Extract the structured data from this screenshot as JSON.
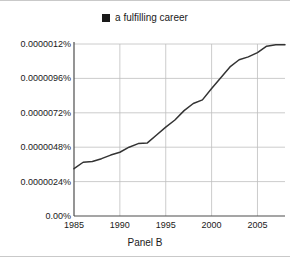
{
  "legend": {
    "marker": "filled-square",
    "marker_color": "#1a1a1a",
    "label": "a fulfilling career"
  },
  "caption": "Panel B",
  "axes": {
    "y_tick_labels": [
      "0.00%",
      "0.0000024%",
      "0.0000048%",
      "0.0000072%",
      "0.0000096%",
      "0.0000012%"
    ],
    "x_tick_labels": [
      "1985",
      "1990",
      "1995",
      "2000",
      "2005"
    ]
  },
  "colors": {
    "line": "#333333",
    "grid": "#bfbfbf",
    "axis": "#4d4d4d",
    "background": "#ffffff",
    "border": "#c9c9c9"
  },
  "chart_data": {
    "type": "line",
    "title": "",
    "subtitle": "",
    "caption": "Panel B",
    "xlabel": "",
    "ylabel": "",
    "grid": true,
    "legend_position": "top-center",
    "xlim": [
      1985,
      2008
    ],
    "ylim": [
      0,
      1.2e-08
    ],
    "x_ticks": [
      1985,
      1990,
      1995,
      2000,
      2005
    ],
    "x_tick_labels": [
      "1985",
      "1990",
      "1995",
      "2000",
      "2005"
    ],
    "y_ticks": [
      0,
      2.4e-09,
      4.8e-09,
      7.2e-09,
      9.6e-09,
      1.2e-08
    ],
    "y_tick_labels": [
      "0.00%",
      "0.0000024%",
      "0.0000048%",
      "0.0000072%",
      "0.0000096%",
      "0.0000012%"
    ],
    "y_unit": "percent",
    "series": [
      {
        "name": "a fulfilling career",
        "color": "#333333",
        "x": [
          1985,
          1986,
          1987,
          1988,
          1989,
          1990,
          1991,
          1992,
          1993,
          1994,
          1995,
          1996,
          1997,
          1998,
          1999,
          2000,
          2001,
          2002,
          2003,
          2004,
          2005,
          2006,
          2007,
          2008
        ],
        "values": [
          3.3e-09,
          3.75e-09,
          3.8e-09,
          4e-09,
          4.25e-09,
          4.45e-09,
          4.8e-09,
          5.05e-09,
          5.1e-09,
          5.65e-09,
          6.2e-09,
          6.7e-09,
          7.35e-09,
          7.85e-09,
          8.1e-09,
          8.9e-09,
          9.65e-09,
          1.04e-08,
          1.09e-08,
          1.11e-08,
          1.14e-08,
          1.185e-08,
          1.195e-08,
          1.195e-08
        ]
      }
    ]
  }
}
